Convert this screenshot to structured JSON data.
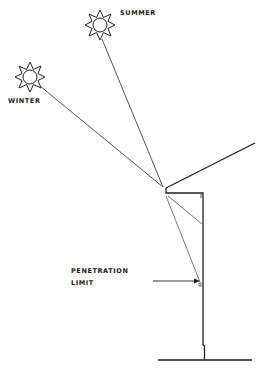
{
  "diagram": {
    "type": "sun-angle-overhang-section",
    "labels": {
      "summer": "SUMMER",
      "winter": "WINTER",
      "penetration_line1": "PENETRATION",
      "penetration_line2": "LIMIT"
    },
    "colors": {
      "ink": "#222222",
      "ray": "#555555",
      "background": "#ffffff"
    },
    "suns": [
      {
        "name": "summer",
        "cx": 100,
        "cy": 25
      },
      {
        "name": "winter",
        "cx": 30,
        "cy": 77
      }
    ]
  }
}
